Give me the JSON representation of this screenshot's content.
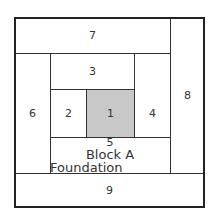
{
  "diagram": {
    "title": "Block A",
    "subtitle": "Foundation Pattern",
    "pieces": [
      {
        "id": "1",
        "label": "1",
        "fill": "#c8c8c8"
      },
      {
        "id": "2",
        "label": "2",
        "fill": "#ffffff"
      },
      {
        "id": "3",
        "label": "3",
        "fill": "#ffffff"
      },
      {
        "id": "4",
        "label": "4",
        "fill": "#ffffff"
      },
      {
        "id": "5",
        "label": "5",
        "fill": "#ffffff"
      },
      {
        "id": "6",
        "label": "6",
        "fill": "#ffffff"
      },
      {
        "id": "7",
        "label": "7",
        "fill": "#ffffff"
      },
      {
        "id": "8",
        "label": "8",
        "fill": "#ffffff"
      },
      {
        "id": "9",
        "label": "9",
        "fill": "#ffffff"
      }
    ]
  }
}
